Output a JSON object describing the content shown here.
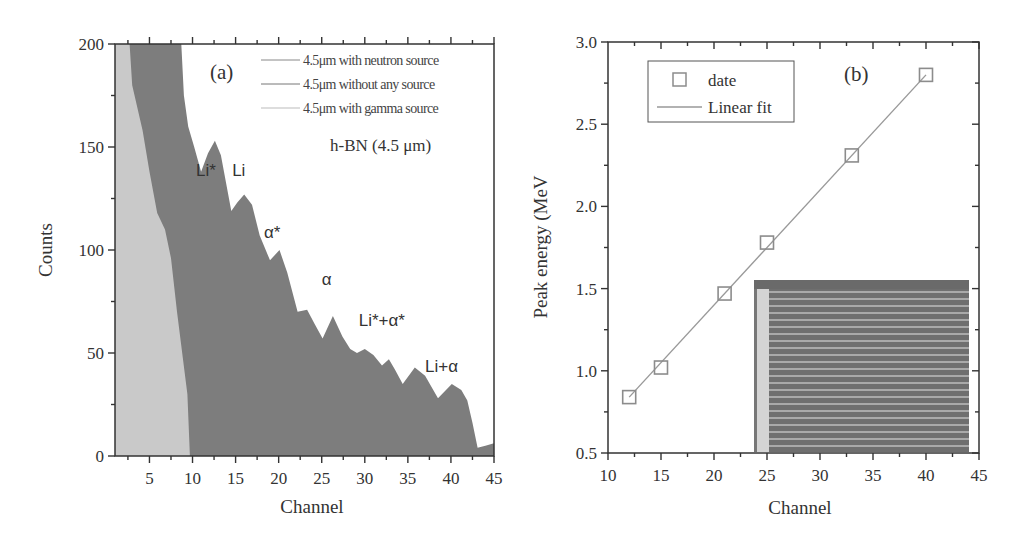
{
  "panels": {
    "a": {
      "label": "(a)",
      "xlabel": "Channel",
      "ylabel": "Counts",
      "annotation": "h-BN (4.5 μm)",
      "legend": [
        "4.5μm with neutron source",
        "4.5μm without any source",
        "4.5μm with gamma source"
      ],
      "peak_labels": [
        {
          "text": "Li*",
          "ch": 10.4,
          "counts": 136
        },
        {
          "text": "Li",
          "ch": 14.6,
          "counts": 136
        },
        {
          "text": "α*",
          "ch": 18.3,
          "counts": 106
        },
        {
          "text": "α",
          "ch": 25.0,
          "counts": 83
        },
        {
          "text": "Li*+α*",
          "ch": 29.3,
          "counts": 63
        },
        {
          "text": "Li+α",
          "ch": 37.0,
          "counts": 41
        }
      ],
      "xticks": [
        "5",
        "10",
        "15",
        "20",
        "25",
        "30",
        "35",
        "40",
        "45"
      ],
      "yticks": [
        "0",
        "50",
        "100",
        "150",
        "200"
      ]
    },
    "b": {
      "label": "(b)",
      "xlabel": "Channel",
      "ylabel": "Peak energy (MeV",
      "legend": [
        "date",
        "Linear fit"
      ],
      "xticks": [
        "10",
        "15",
        "20",
        "25",
        "30",
        "35",
        "40",
        "45"
      ],
      "yticks": [
        "0.5",
        "1.0",
        "1.5",
        "2.0",
        "2.5",
        "3.0"
      ]
    }
  },
  "colors": {
    "neutron_fill": "#7d7d7d",
    "gamma_fill": "#c9c9c9",
    "marker": "#8c8c8c",
    "fit_line": "#999999",
    "axis": "#333333"
  },
  "chart_data": [
    {
      "type": "area",
      "title": "(a) h-BN (4.5 μm)",
      "xlabel": "Channel",
      "ylabel": "Counts",
      "xlim": [
        1,
        45
      ],
      "ylim": [
        0,
        200
      ],
      "grid": false,
      "legend_position": "upper right",
      "legend": [
        "4.5μm with neutron source",
        "4.5μm without any source",
        "4.5μm with gamma source"
      ],
      "series": [
        {
          "name": "4.5μm with neutron source",
          "x": [
            1,
            8.7,
            9.0,
            9.5,
            10.2,
            11.0,
            11.8,
            12.6,
            13.3,
            14.5,
            15.2,
            16.0,
            16.9,
            17.8,
            19.0,
            20.1,
            21.0,
            22.2,
            23.3,
            24.2,
            25.1,
            26.3,
            27.4,
            28.3,
            29.1,
            30.0,
            31.0,
            32.0,
            32.8,
            33.5,
            34.4,
            35.8,
            37.0,
            38.5,
            40.1,
            41.2,
            41.9,
            42.5,
            43.1,
            44.0,
            44.9,
            45
          ],
          "y": [
            200,
            200,
            175,
            160,
            150,
            138,
            147,
            153,
            146,
            119,
            123,
            127,
            122,
            107,
            95,
            100,
            89,
            70,
            71,
            64,
            57,
            68,
            58,
            52,
            50,
            52,
            49,
            44,
            47,
            42,
            35,
            43,
            39,
            28,
            35,
            32,
            27,
            16,
            4,
            5,
            6,
            6
          ]
        },
        {
          "name": "4.5μm with gamma source",
          "x": [
            1,
            2.7,
            3.0,
            4.2,
            5.0,
            5.9,
            6.8,
            7.5,
            8.2,
            9.4,
            9.7
          ],
          "y": [
            200,
            200,
            180,
            158,
            138,
            118,
            110,
            96,
            70,
            30,
            0
          ]
        },
        {
          "name": "4.5μm without any source",
          "x": [],
          "y": []
        }
      ],
      "annotations": [
        "Li*",
        "Li",
        "α*",
        "α",
        "Li*+α*",
        "Li+α",
        "(a)",
        "h-BN (4.5 μm)"
      ]
    },
    {
      "type": "scatter",
      "title": "(b)",
      "xlabel": "Channel",
      "ylabel": "Peak energy (MeV",
      "xlim": [
        10,
        45
      ],
      "ylim": [
        0.5,
        3.0
      ],
      "grid": false,
      "legend_position": "upper left",
      "series": [
        {
          "name": "date",
          "x": [
            12,
            15,
            21,
            25,
            33,
            40
          ],
          "y": [
            0.84,
            1.02,
            1.47,
            1.78,
            2.31,
            2.8
          ]
        },
        {
          "name": "Linear fit",
          "x": [
            12,
            40
          ],
          "y": [
            0.84,
            2.8
          ]
        }
      ],
      "inset": "micrograph of interdigitated electrode stripes (lower right)"
    }
  ]
}
